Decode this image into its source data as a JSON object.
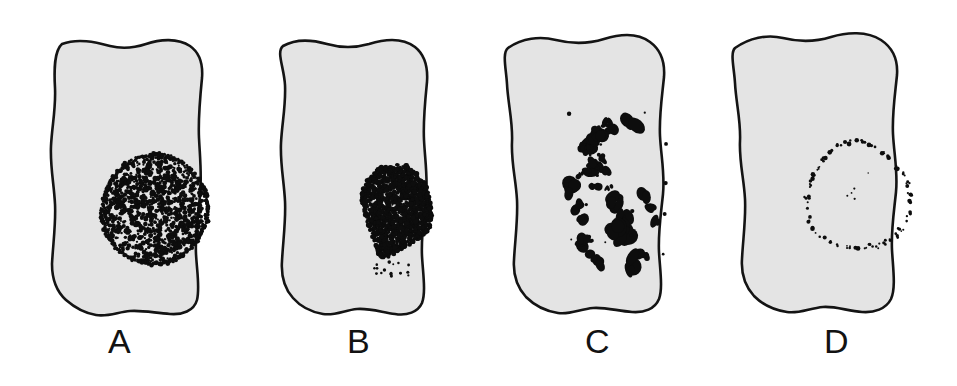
{
  "figure": {
    "background_color": "#ffffff",
    "cell_fill_color": "#e4e4e4",
    "cell_outline_color": "#141414",
    "label_color": "#121212",
    "chromatin_color": "#0d0d0d",
    "panel_count": 4
  },
  "panels": [
    {
      "label": "A",
      "pattern_name": "dispersed-chromatin-round-nucleus",
      "description": "Large round nucleus filled with dense, evenly dispersed stippled chromatin",
      "nucleus_shape": "circle",
      "nucleus_center_x": 155,
      "nucleus_center_y": 209,
      "nucleus_diameter": 108,
      "dot_count": 1400,
      "dot_density": "dense",
      "dot_size_range": [
        1.0,
        2.6
      ]
    },
    {
      "label": "B",
      "pattern_name": "condensed-chromatin-mass",
      "description": "Compact teardrop-shaped condensed chromatin mass in lower right of cell",
      "nucleus_shape": "teardrop",
      "nucleus_center_x": 395,
      "nucleus_center_y": 212,
      "nucleus_width": 74,
      "nucleus_height": 98,
      "dot_count": 1500,
      "dot_density": "very-dense",
      "dot_size_range": [
        1.0,
        2.8
      ]
    },
    {
      "label": "C",
      "pattern_name": "discrete-chromosome-clusters",
      "description": "Scattered discrete dark chromosome blobs arranged in a vertical elongated group",
      "nucleus_shape": "scattered-clusters",
      "nucleus_center_x": 613,
      "nucleus_center_y": 188,
      "cluster_count": 34,
      "cluster_size_range": [
        3,
        11
      ]
    },
    {
      "label": "D",
      "pattern_name": "peripheral-ring-labeling",
      "description": "Sparse fine dots forming a ring at the nuclear periphery, interior unlabeled",
      "nucleus_shape": "ring",
      "nucleus_center_x": 858,
      "nucleus_center_y": 197,
      "ring_diameter": 100,
      "dot_count": 78,
      "dot_size_range": [
        0.9,
        2.4
      ]
    }
  ]
}
